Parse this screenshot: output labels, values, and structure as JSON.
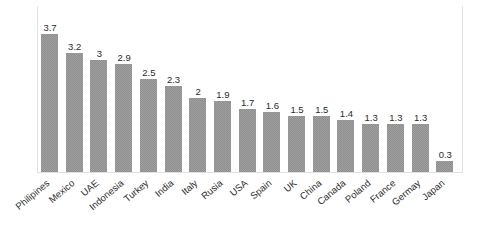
{
  "chart_data": {
    "type": "bar",
    "title": "",
    "subtitle": "",
    "xlabel": "",
    "ylabel": "",
    "ylim": [
      0,
      4
    ],
    "grid": false,
    "legend": false,
    "legend_position": "none",
    "orientation": "vertical",
    "bar_color": "#a0a0a0",
    "bar_fill_pattern": "fine-gray-checker",
    "data_labels_shown": true,
    "axis_tick_labels_y": [],
    "categories": [
      "Philipines",
      "Mexico",
      "UAE",
      "Indonesia",
      "Turkey",
      "India",
      "Italy",
      "Rusia",
      "USA",
      "Spain",
      "UK",
      "China",
      "Canada",
      "Poland",
      "France",
      "Germay",
      "Japan"
    ],
    "values": [
      3.7,
      3.2,
      3,
      2.9,
      2.5,
      2.3,
      2,
      1.9,
      1.7,
      1.6,
      1.5,
      1.5,
      1.4,
      1.3,
      1.3,
      1.3,
      0.3
    ],
    "value_labels": [
      "3.7",
      "3.2",
      "3",
      "2.9",
      "2.5",
      "2.3",
      "2",
      "1.9",
      "1.7",
      "1.6",
      "1.5",
      "1.5",
      "1.4",
      "1.3",
      "1.3",
      "1.3",
      "0.3"
    ]
  },
  "colors": {
    "bar": "#a0a0a0",
    "bar_pattern": "#8e8e8e",
    "text": "#2b2b2b",
    "frame": "#e3e3e3",
    "baseline": "#e0e0e0",
    "background": "#ffffff"
  }
}
